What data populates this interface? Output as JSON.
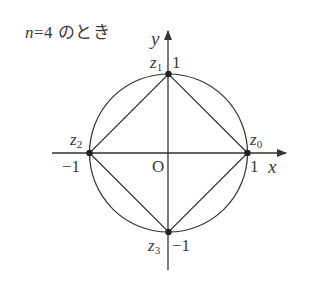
{
  "title": {
    "variable": "n",
    "equals": "=4",
    "suffix": " のとき"
  },
  "axes": {
    "x_label": "x",
    "y_label": "y",
    "origin_label": "O"
  },
  "ticks": {
    "x_pos": "1",
    "x_neg": "−1",
    "y_pos": "1",
    "y_neg": "−1"
  },
  "points": [
    {
      "name": "z",
      "sub": "0",
      "x": 1,
      "y": 0
    },
    {
      "name": "z",
      "sub": "1",
      "x": 0,
      "y": 1
    },
    {
      "name": "z",
      "sub": "2",
      "x": -1,
      "y": 0
    },
    {
      "name": "z",
      "sub": "3",
      "x": 0,
      "y": -1
    }
  ],
  "colors": {
    "line": "#333333",
    "text": "#3a3a3a"
  }
}
